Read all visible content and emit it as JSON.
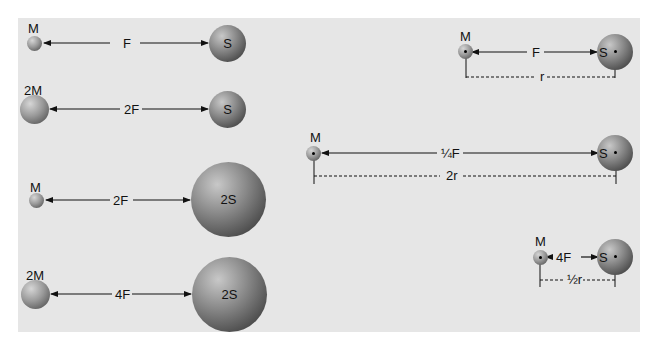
{
  "diagram": {
    "left_column": [
      {
        "small_label": "M",
        "force_label": "F",
        "large_label": "S"
      },
      {
        "small_label": "2M",
        "force_label": "2F",
        "large_label": "S"
      },
      {
        "small_label": "M",
        "force_label": "2F",
        "large_label": "2S"
      },
      {
        "small_label": "2M",
        "force_label": "4F",
        "large_label": "2S"
      }
    ],
    "right_column": [
      {
        "small_label": "M",
        "force_label": "F",
        "large_label": "S",
        "distance_label": "r"
      },
      {
        "small_label": "M",
        "force_label": "¼F",
        "large_label": "S",
        "distance_label": "2r"
      },
      {
        "small_label": "M",
        "force_label": "4F",
        "large_label": "S",
        "distance_label": "½r"
      }
    ]
  }
}
